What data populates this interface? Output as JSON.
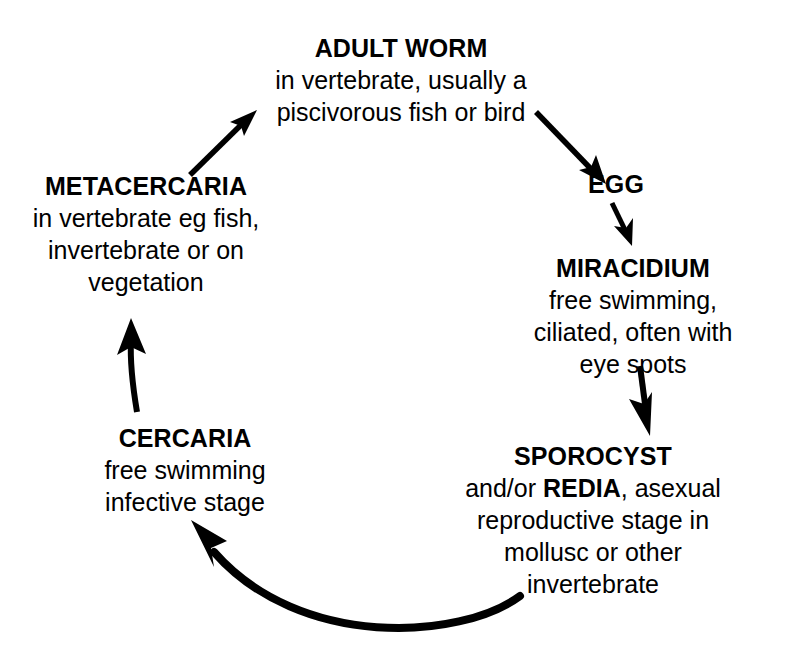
{
  "diagram": {
    "background_color": "#ffffff",
    "ink_color": "#000000",
    "stages": [
      {
        "id": "adult-worm",
        "title": "ADULT WORM",
        "lines": [
          "in vertebrate, usually a",
          "piscivorous fish or bird"
        ]
      },
      {
        "id": "egg",
        "title": "EGG",
        "lines": []
      },
      {
        "id": "miracidium",
        "title": "MIRACIDIUM",
        "lines": [
          "free swimming,",
          "ciliated, often with",
          "eye spots"
        ]
      },
      {
        "id": "sporocyst",
        "title": "SPOROCYST",
        "lines_html": [
          "and/or <b>REDIA</b>, asexual",
          "reproductive stage in",
          "mollusc or other",
          "invertebrate"
        ],
        "lines": [
          "and/or REDIA, asexual",
          "reproductive stage in",
          "mollusc or other",
          "invertebrate"
        ],
        "emphasis_word": "REDIA"
      },
      {
        "id": "cercaria",
        "title": "CERCARIA",
        "lines": [
          "free swimming",
          "infective stage"
        ]
      },
      {
        "id": "metacercaria",
        "title": "METACERCARIA",
        "lines": [
          "in vertebrate eg fish,",
          "invertebrate or on",
          "vegetation"
        ]
      }
    ],
    "arrows": [
      {
        "id": "metacercaria-to-adult-worm",
        "from": "METACERCARIA",
        "to": "ADULT WORM",
        "direction": "up-right",
        "style": "straight"
      },
      {
        "id": "adult-worm-to-egg",
        "from": "ADULT WORM",
        "to": "EGG",
        "direction": "down-right",
        "style": "straight"
      },
      {
        "id": "egg-to-miracidium",
        "from": "EGG",
        "to": "MIRACIDIUM",
        "direction": "down",
        "style": "straight-short"
      },
      {
        "id": "miracidium-to-sporocyst",
        "from": "MIRACIDIUM",
        "to": "SPOROCYST",
        "direction": "down",
        "style": "straight"
      },
      {
        "id": "sporocyst-to-cercaria",
        "from": "SPOROCYST",
        "to": "CERCARIA",
        "direction": "left-up",
        "style": "curved-thick"
      },
      {
        "id": "cercaria-to-metacercaria",
        "from": "CERCARIA",
        "to": "METACERCARIA",
        "direction": "up",
        "style": "curved-slight"
      }
    ]
  }
}
